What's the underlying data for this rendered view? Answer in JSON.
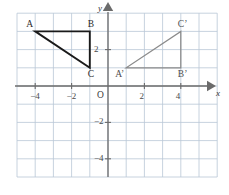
{
  "figure": {
    "type": "coordinate-plane-geometry",
    "background_color": "#ffffff",
    "grid_color": "#b9c6d6",
    "axis_color": "#6b6b6b",
    "shape_color": "#1a1a1a",
    "image_shape_color": "#8a8a8a"
  },
  "axes": {
    "x_axis_name": "x",
    "y_axis_name": "y",
    "origin_label": "O",
    "x_ticks": [
      {
        "value": -4,
        "label": "−4"
      },
      {
        "value": -2,
        "label": "−2"
      },
      {
        "value": 2,
        "label": "2"
      },
      {
        "value": 4,
        "label": "4"
      }
    ],
    "y_ticks": [
      {
        "value": 2,
        "label": "2"
      },
      {
        "value": -2,
        "label": "−2"
      },
      {
        "value": -4,
        "label": "−4"
      }
    ],
    "x_range": [
      -5,
      6
    ],
    "y_range": [
      -5,
      4
    ],
    "grid": true,
    "grid_step": 1
  },
  "shapes": [
    {
      "name": "triangle-abc",
      "style": "solid-dark",
      "vertices": [
        {
          "label": "A",
          "x": -4,
          "y": 3,
          "label_dx": -9,
          "label_dy": -11
        },
        {
          "label": "B",
          "x": -1,
          "y": 3,
          "label_dx": -2,
          "label_dy": -11
        },
        {
          "label": "C",
          "x": -1,
          "y": 1,
          "label_dx": -2,
          "label_dy": 2
        }
      ]
    },
    {
      "name": "triangle-a-prime-b-prime-c-prime",
      "style": "solid-light",
      "vertices": [
        {
          "label": "A’",
          "x": 1,
          "y": 1,
          "label_dx": -11,
          "label_dy": 2
        },
        {
          "label": "B’",
          "x": 4,
          "y": 1,
          "label_dx": -3,
          "label_dy": 2
        },
        {
          "label": "C’",
          "x": 4,
          "y": 3,
          "label_dx": -3,
          "label_dy": -11
        }
      ]
    }
  ]
}
